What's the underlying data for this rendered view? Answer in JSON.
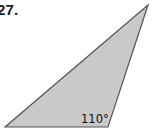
{
  "problem": {
    "number": "27."
  },
  "triangle": {
    "vertices": {
      "top": [
        148,
        5
      ],
      "bottom_left": [
        5,
        127
      ],
      "bottom_right": [
        108,
        127
      ]
    },
    "fill_color": "#c9c9c9",
    "stroke_color": "#555555",
    "angle_label": "110°",
    "angle_vertex": "bottom_right"
  }
}
